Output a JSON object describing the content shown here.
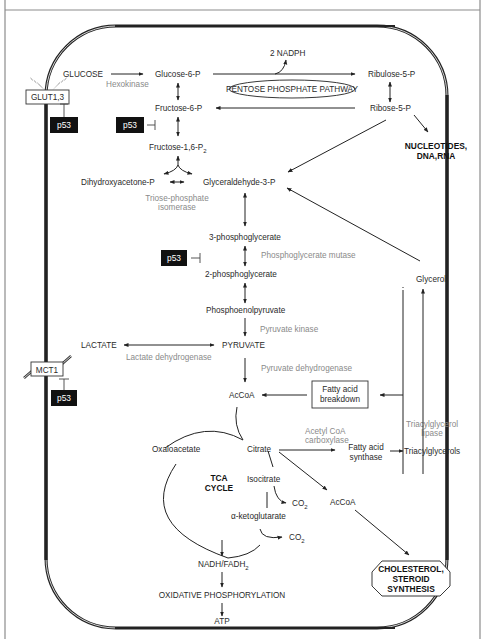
{
  "diagram": {
    "colors": {
      "text": "#2a2a2a",
      "enzyme": "#8a8a8a",
      "p53_box": "#111111",
      "frame": "#8c8c8c",
      "membrane": "#222222"
    },
    "transporters": {
      "glut": "GLUT1,3",
      "mct": "MCT1"
    },
    "regulators": {
      "p53_1": "p53",
      "p53_2": "p53",
      "p53_3": "p53",
      "p53_4": "p53"
    },
    "metabolites": {
      "glucose": "GLUCOSE",
      "g6p": "Glucose-6-P",
      "f6p": "Fructose-6-P",
      "f16p": "Fructose-1,6-P",
      "f16p_sub": "2",
      "dhap": "Dihydroxyacetone-P",
      "g3p": "Glyceraldehyde-3-P",
      "pg3": "3-phosphoglycerate",
      "pg2": "2-phosphoglycerate",
      "pep": "Phosphoenolpyruvate",
      "pyruvate": "PYRUVATE",
      "lactate": "LACTATE",
      "accoa": "AcCoA",
      "accoa2": "AcCoA",
      "oxaloacetate": "Oxaloacetate",
      "citrate": "Citrate",
      "isocitrate": "Isocitrate",
      "akg": "α-ketoglutarate",
      "co2_1": "CO",
      "co2_2": "CO",
      "co2_sub": "2",
      "nadh": "NADH/FADH",
      "nadh_sub": "2",
      "oxphos": "OXIDATIVE PHOSPHORYLATION",
      "atp": "ATP",
      "nadph": "2 NADPH",
      "ribulose": "Ribulose-5-P",
      "ribose": "Ribose-5-P",
      "glycerol": "Glycerol",
      "fa_synthase_1": "Fatty acid",
      "fa_synthase_2": "synthase",
      "tag": "Triacylglycerols"
    },
    "enzymes": {
      "hexokinase": "Hexokinase",
      "tpi_1": "Triose-phosphate",
      "tpi_2": "isomerase",
      "pgm": "Phosphoglycerate mutase",
      "pk": "Pyruvate kinase",
      "ldh": "Lactate dehydrogenase",
      "pdh": "Pyruvate dehydrogenase",
      "acc_1": "Acetyl CoA",
      "acc_2": "carboxylase",
      "tgl_1": "Triacylglycerol",
      "tgl_2": "lipase"
    },
    "boxes": {
      "ppp": "PENTOSE PHOSPHATE PATHWAY",
      "fab_1": "Fatty acid",
      "fab_2": "breakdown",
      "tca_1": "TCA",
      "tca_2": "CYCLE",
      "nucleotides_1": "NUCLEOTIDES,",
      "nucleotides_2": "DNA,RNA",
      "chol_1": "CHOLESTEROL,",
      "chol_2": "STEROID",
      "chol_3": "SYNTHESIS"
    }
  }
}
